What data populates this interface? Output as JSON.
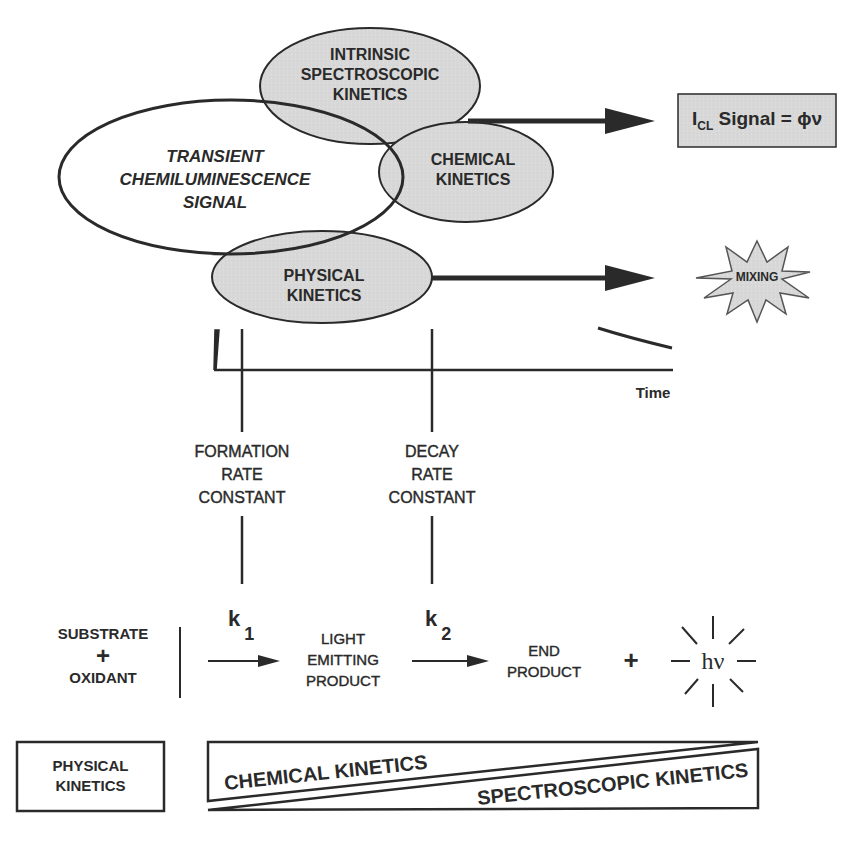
{
  "colors": {
    "ink": "#2a2a2a",
    "ellipse_fill": "#d9d9d9",
    "box_fill": "#e2e2e2",
    "background": "#ffffff"
  },
  "venn": {
    "transient_signal": [
      "TRANSIENT",
      "CHEMILUMINESCENCE",
      "SIGNAL"
    ],
    "intrinsic_spectroscopic": [
      "INTRINSIC",
      "SPECTROSCOPIC",
      "KINETICS"
    ],
    "chemical": [
      "CHEMICAL",
      "KINETICS"
    ],
    "physical": [
      "PHYSICAL",
      "KINETICS"
    ]
  },
  "outputs": {
    "signal_box": {
      "prefix": "I",
      "subscript": "CL",
      "text": " Signal = ϕν"
    },
    "mixing_burst": "MIXING"
  },
  "time_axis": {
    "label": "Time"
  },
  "rate_constants": {
    "formation": [
      "FORMATION",
      "RATE",
      "CONSTANT"
    ],
    "decay": [
      "DECAY",
      "RATE",
      "CONSTANT"
    ]
  },
  "reaction": {
    "reactants": {
      "line1": "SUBSTRATE",
      "plus": "+",
      "line2": "OXIDANT"
    },
    "k1": {
      "symbol": "k",
      "subscript": "1"
    },
    "intermediate": [
      "LIGHT",
      "EMITTING",
      "PRODUCT"
    ],
    "k2": {
      "symbol": "k",
      "subscript": "2"
    },
    "product": [
      "END",
      "PRODUCT"
    ],
    "plus": "+",
    "photon": "hν"
  },
  "bottom": {
    "physical_box": [
      "PHYSICAL",
      "KINETICS"
    ],
    "chemical_wedge": "CHEMICAL KINETICS",
    "spectroscopic_wedge": "SPECTROSCOPIC KINETICS"
  }
}
